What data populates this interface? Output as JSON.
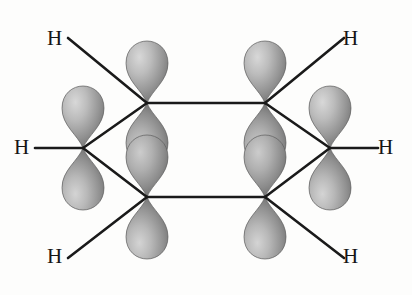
{
  "figure": {
    "kind": "molecular-orbital-diagram",
    "molecule_label": "benzene",
    "background_color": "#fdfdfc",
    "bond_color": "#1a1a1a",
    "bond_width": 2.6,
    "label_color": "#151515",
    "orbital_fill_light": "#cfcfcf",
    "orbital_fill_mid": "#9a9a9a",
    "orbital_fill_dark": "#6e6e6e",
    "orbital_edge": "#5d5d5d"
  },
  "atom_labels": [
    {
      "id": "h-top-left",
      "text": "H",
      "x": 47,
      "y": 28
    },
    {
      "id": "h-mid-left",
      "text": "H",
      "x": 14,
      "y": 137
    },
    {
      "id": "h-bottom-left",
      "text": "H",
      "x": 47,
      "y": 246
    },
    {
      "id": "h-top-right",
      "text": "H",
      "x": 343,
      "y": 28
    },
    {
      "id": "h-mid-right",
      "text": "H",
      "x": 378,
      "y": 137
    },
    {
      "id": "h-bottom-right",
      "text": "H",
      "x": 343,
      "y": 246
    }
  ],
  "carbon_vertices": [
    {
      "id": "c-top-left",
      "x": 147,
      "y": 103
    },
    {
      "id": "c-top-right",
      "x": 265,
      "y": 103
    },
    {
      "id": "c-mid-right",
      "x": 330,
      "y": 148
    },
    {
      "id": "c-bottom-right",
      "x": 265,
      "y": 197
    },
    {
      "id": "c-bottom-left",
      "x": 147,
      "y": 197
    },
    {
      "id": "c-mid-left",
      "x": 83,
      "y": 148
    }
  ],
  "ring_bonds": [
    {
      "id": "bond-top",
      "x1": 147,
      "y1": 103,
      "x2": 265,
      "y2": 103
    },
    {
      "id": "bond-upper-right",
      "x1": 265,
      "y1": 103,
      "x2": 330,
      "y2": 148
    },
    {
      "id": "bond-lower-right",
      "x1": 330,
      "y1": 148,
      "x2": 265,
      "y2": 197
    },
    {
      "id": "bond-bottom",
      "x1": 265,
      "y1": 197,
      "x2": 147,
      "y2": 197
    },
    {
      "id": "bond-lower-left",
      "x1": 147,
      "y1": 197,
      "x2": 83,
      "y2": 148
    },
    {
      "id": "bond-upper-left",
      "x1": 83,
      "y1": 148,
      "x2": 147,
      "y2": 103
    }
  ],
  "ch_bonds": [
    {
      "id": "chbond-top-left",
      "x1": 147,
      "y1": 103,
      "x2": 68,
      "y2": 38
    },
    {
      "id": "chbond-mid-left",
      "x1": 83,
      "y1": 148,
      "x2": 35,
      "y2": 148
    },
    {
      "id": "chbond-bottom-left",
      "x1": 147,
      "y1": 197,
      "x2": 68,
      "y2": 258
    },
    {
      "id": "chbond-top-right",
      "x1": 265,
      "y1": 103,
      "x2": 344,
      "y2": 38
    },
    {
      "id": "chbond-mid-right",
      "x1": 330,
      "y1": 148,
      "x2": 378,
      "y2": 148
    },
    {
      "id": "chbond-bottom-right",
      "x1": 265,
      "y1": 197,
      "x2": 344,
      "y2": 258
    }
  ],
  "p_orbitals": [
    {
      "id": "orbital-top-left",
      "cx": 147,
      "cy": 103,
      "axis": "vertical",
      "lobe_height": 62,
      "lobe_width": 42
    },
    {
      "id": "orbital-top-right",
      "cx": 265,
      "cy": 103,
      "axis": "vertical",
      "lobe_height": 62,
      "lobe_width": 42
    },
    {
      "id": "orbital-mid-right",
      "cx": 330,
      "cy": 148,
      "axis": "vertical",
      "lobe_height": 62,
      "lobe_width": 42
    },
    {
      "id": "orbital-bottom-right",
      "cx": 265,
      "cy": 197,
      "axis": "vertical",
      "lobe_height": 62,
      "lobe_width": 42
    },
    {
      "id": "orbital-bottom-left",
      "cx": 147,
      "cy": 197,
      "axis": "vertical",
      "lobe_height": 62,
      "lobe_width": 42
    },
    {
      "id": "orbital-mid-left",
      "cx": 83,
      "cy": 148,
      "axis": "vertical",
      "lobe_height": 62,
      "lobe_width": 42
    }
  ]
}
